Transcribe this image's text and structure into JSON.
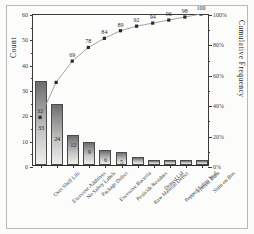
{
  "chart_data": {
    "type": "bar",
    "title": "",
    "xlabel": "",
    "ylabel": "Count",
    "y2label": "Cumulative Frequency",
    "ylim": [
      0,
      60
    ],
    "y2lim": [
      0,
      100
    ],
    "grid": false,
    "legend": "none",
    "categories": [
      "Over Shelf Life",
      "Excessive Additives",
      "No Safety Labels",
      "Package Defect",
      "Excessive Bacteria",
      "Pesticide Residues",
      "Raw Material Defect",
      "Dented Lid",
      "Popped Safety Seal",
      "Freezer Burn",
      "Stain on Box"
    ],
    "series": [
      {
        "name": "Count",
        "type": "bar",
        "values": [
          33,
          24,
          12,
          9,
          6,
          5,
          3,
          2,
          2,
          2,
          2
        ]
      },
      {
        "name": "Cumulative Frequency",
        "type": "line",
        "values": [
          32,
          55,
          69,
          78,
          84,
          89,
          92,
          94,
          96,
          98,
          100
        ]
      }
    ],
    "bar_value_labels": [
      "33",
      "24",
      "12",
      "9",
      "6",
      "5",
      "",
      "",
      "",
      "",
      ""
    ],
    "cumulative_labels": [
      "32",
      "",
      "69",
      "78",
      "84",
      "89",
      "92",
      "94",
      "96",
      "98",
      "100"
    ],
    "yticks_left": [
      "0",
      "10",
      "20",
      "30",
      "40",
      "50",
      "60"
    ],
    "yticks_right": [
      "0%",
      "20%",
      "40%",
      "60%",
      "80%",
      "100%"
    ]
  },
  "colors": {
    "background": "#fbfbfa",
    "panel": "#fcfcfb",
    "axis": "#3a3a3a",
    "bar_top": "#6e6e6e",
    "bar_bottom": "#eeeeec",
    "bar_border": "#4a4a4a",
    "line": "#9a9a9a",
    "marker": "#2b2b2b",
    "border": "#b9b9b6"
  }
}
